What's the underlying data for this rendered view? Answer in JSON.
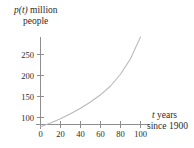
{
  "figure": {
    "y_axis_label": {
      "line1_var": "p(t)",
      "line1_rest": " million",
      "line2": "people"
    },
    "x_axis_label": {
      "line1_var": "t",
      "line1_rest": " years",
      "line2": "since 1900"
    }
  },
  "chart_data": {
    "type": "line",
    "title": "",
    "xlabel": "t years since 1900",
    "ylabel": "p(t) million people",
    "xlim": [
      0,
      105
    ],
    "ylim": [
      70,
      300
    ],
    "grid": false,
    "legend": "none",
    "x_ticks": [
      0,
      20,
      40,
      60,
      80,
      100
    ],
    "x_tick_labels": [
      "0",
      "20",
      "40",
      "60",
      "80",
      "100"
    ],
    "y_ticks": [
      100,
      150,
      200,
      250
    ],
    "y_tick_labels": [
      "100",
      "150",
      "200",
      "250"
    ],
    "series": [
      {
        "name": "p(t)",
        "color": "#b9b9b9",
        "x": [
          0,
          10,
          20,
          30,
          40,
          50,
          60,
          70,
          80,
          90,
          100
        ],
        "y": [
          78,
          87,
          97,
          108,
          120,
          134,
          150,
          168,
          188,
          210,
          290
        ]
      }
    ],
    "curve_points": [
      [
        0,
        78
      ],
      [
        10,
        87
      ],
      [
        20,
        97
      ],
      [
        30,
        109
      ],
      [
        40,
        122
      ],
      [
        50,
        137
      ],
      [
        60,
        154
      ],
      [
        70,
        175
      ],
      [
        80,
        203
      ],
      [
        90,
        240
      ],
      [
        100,
        292
      ]
    ]
  },
  "colors": {
    "axis": "#8e8e8e",
    "curve": "#b9b9b9",
    "text": "#2b2b2b",
    "background": "#ffffff"
  }
}
